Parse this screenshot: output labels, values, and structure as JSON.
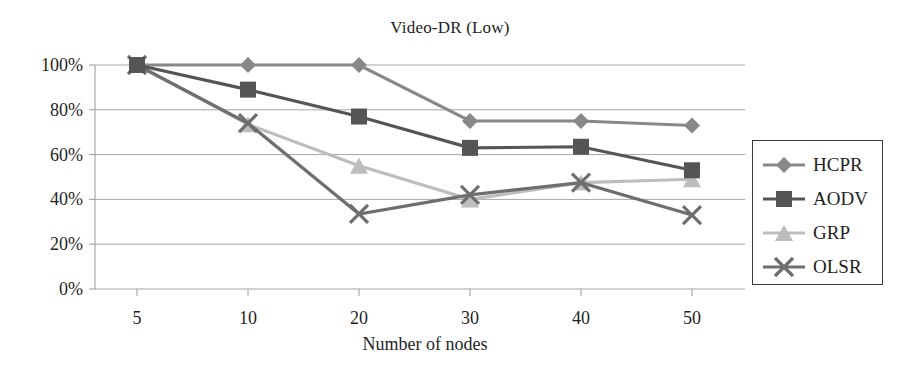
{
  "chart_data": {
    "type": "line",
    "title": "Video-DR (Low)",
    "xlabel": "Number of nodes",
    "ylabel": "",
    "categories": [
      "5",
      "10",
      "20",
      "30",
      "40",
      "50"
    ],
    "x": [
      5,
      10,
      20,
      30,
      40,
      50
    ],
    "ylim": [
      0,
      100
    ],
    "ytick_labels": [
      "0%",
      "20%",
      "40%",
      "60%",
      "80%",
      "100%"
    ],
    "ytick_values": [
      0,
      20,
      40,
      60,
      80,
      100
    ],
    "grid": true,
    "legend_position": "right",
    "series": [
      {
        "name": "HCPR",
        "marker": "diamond",
        "color": "#888888",
        "values": [
          100,
          100,
          100,
          75,
          75,
          73
        ]
      },
      {
        "name": "AODV",
        "marker": "square",
        "color": "#555555",
        "values": [
          100,
          89,
          77,
          63,
          63.5,
          53
        ]
      },
      {
        "name": "GRP",
        "marker": "triangle",
        "color": "#bdbdbd",
        "values": [
          100,
          73.5,
          55,
          40,
          47.5,
          49
        ]
      },
      {
        "name": "OLSR",
        "marker": "x",
        "color": "#6e6e6e",
        "values": [
          100,
          74,
          33.5,
          42,
          47.5,
          33
        ]
      }
    ]
  },
  "colors": {
    "gridline": "#a6a6a6",
    "axis": "#9a9a9a",
    "text": "#1f1f1f",
    "legend_border": "#3a3a3a",
    "background": "#ffffff"
  }
}
